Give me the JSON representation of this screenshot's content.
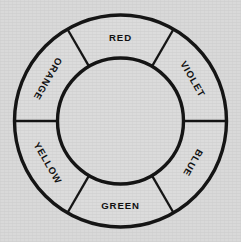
{
  "figure": {
    "name": "color-wheel",
    "background_color": "#d9d9d9",
    "face_color": "#dcdcdc",
    "stroke_color": "#151515"
  },
  "geometry": {
    "center_x": 120.5,
    "center_y": 121,
    "outer_radius": 106,
    "inner_radius": 63,
    "segment_count": 6,
    "segment_span_degrees": 60,
    "divider_angles_degrees": [
      0,
      60,
      120,
      180,
      240,
      300
    ]
  },
  "chart_data": {
    "type": "pie",
    "categories": [
      "RED",
      "VIOLET",
      "BLUE",
      "GREEN",
      "YELLOW",
      "ORANGE"
    ],
    "values": [
      60,
      60,
      60,
      60,
      60,
      60
    ],
    "xlabel": "",
    "ylabel": "",
    "legend": "none",
    "grid": false
  },
  "segments": [
    {
      "label": "RED",
      "start_angle": -120,
      "end_angle": -60,
      "mid_angle": -90,
      "label_x": 120.5,
      "label_y": 37,
      "label_rotation": 0
    },
    {
      "label": "VIOLET",
      "start_angle": -60,
      "end_angle": 0,
      "mid_angle": -30,
      "label_x": 193,
      "label_y": 79,
      "label_rotation": 60
    },
    {
      "label": "BLUE",
      "start_angle": 0,
      "end_angle": 60,
      "mid_angle": 30,
      "label_x": 193,
      "label_y": 163,
      "label_rotation": 120
    },
    {
      "label": "GREEN",
      "start_angle": 60,
      "end_angle": 120,
      "mid_angle": 90,
      "label_x": 120.5,
      "label_y": 205,
      "label_rotation": 0
    },
    {
      "label": "YELLOW",
      "start_angle": 120,
      "end_angle": 180,
      "mid_angle": 150,
      "label_x": 48,
      "label_y": 163,
      "label_rotation": 60
    },
    {
      "label": "ORANGE",
      "start_angle": 180,
      "end_angle": 240,
      "mid_angle": 210,
      "label_x": 48,
      "label_y": 79,
      "label_rotation": 120
    }
  ]
}
